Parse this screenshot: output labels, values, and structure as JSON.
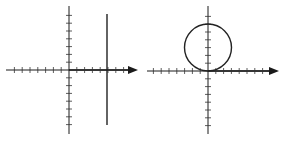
{
  "figure": {
    "colors": {
      "axis": "#1a1a1a",
      "curve": "#222222",
      "tick": "#333333",
      "background": "#ffffff"
    }
  },
  "chart_data": [
    {
      "type": "line",
      "title": "",
      "panel": "left",
      "xlabel": "",
      "ylabel": "",
      "axes": {
        "x_arrow": true,
        "y_arrow": false,
        "tick_spacing_units": 1,
        "x_ticks_negative": 7,
        "x_ticks_positive": 7,
        "y_ticks_positive": 7,
        "y_ticks_negative": 7
      },
      "series": [
        {
          "name": "vertical line",
          "kind": "vertical_line",
          "x": 5,
          "y_range": [
            -7,
            7
          ]
        }
      ]
    },
    {
      "type": "line",
      "title": "",
      "panel": "right",
      "xlabel": "",
      "ylabel": "",
      "axes": {
        "x_arrow": true,
        "y_arrow": false,
        "tick_spacing_units": 1,
        "x_ticks_negative": 7,
        "x_ticks_positive": 7,
        "y_ticks_positive": 7,
        "y_ticks_negative": 7
      },
      "series": [
        {
          "name": "circle",
          "kind": "circle",
          "center": [
            0,
            3
          ],
          "radius": 3
        }
      ]
    }
  ]
}
